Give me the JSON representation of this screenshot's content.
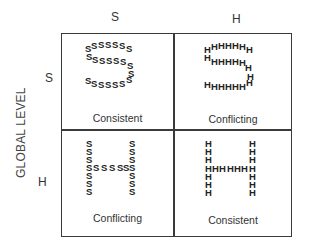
{
  "figure": {
    "column_headers": [
      "S",
      "H"
    ],
    "row_headers": [
      "S",
      "H"
    ],
    "y_axis_label": "GLOBAL LEVEL",
    "cells": [
      {
        "row": "S",
        "col": "S",
        "global_letter": "S",
        "local_letter": "S",
        "caption": "Consistent",
        "rows_text": [
          "SSSSSSS",
          "SSSSSSS",
          "S",
          "SSSSSSS"
        ]
      },
      {
        "row": "S",
        "col": "H",
        "global_letter": "S",
        "local_letter": "H",
        "caption": "Conflicting",
        "rows_text": [
          "HHHHHHH",
          "HHHHHHH",
          "H",
          "HHHHHHH"
        ]
      },
      {
        "row": "H",
        "col": "S",
        "global_letter": "H",
        "local_letter": "S",
        "caption": "Conflicting",
        "rows_text": [
          "S    S",
          "S    S",
          "S    S",
          "SSSSSS",
          "S    S",
          "S    S",
          "S    S"
        ]
      },
      {
        "row": "H",
        "col": "H",
        "global_letter": "H",
        "local_letter": "H",
        "caption": "Consistent",
        "rows_text": [
          "H    H",
          "H    H",
          "H    H",
          "HHHHHH",
          "H    H",
          "H    H",
          "H    H"
        ]
      }
    ]
  }
}
